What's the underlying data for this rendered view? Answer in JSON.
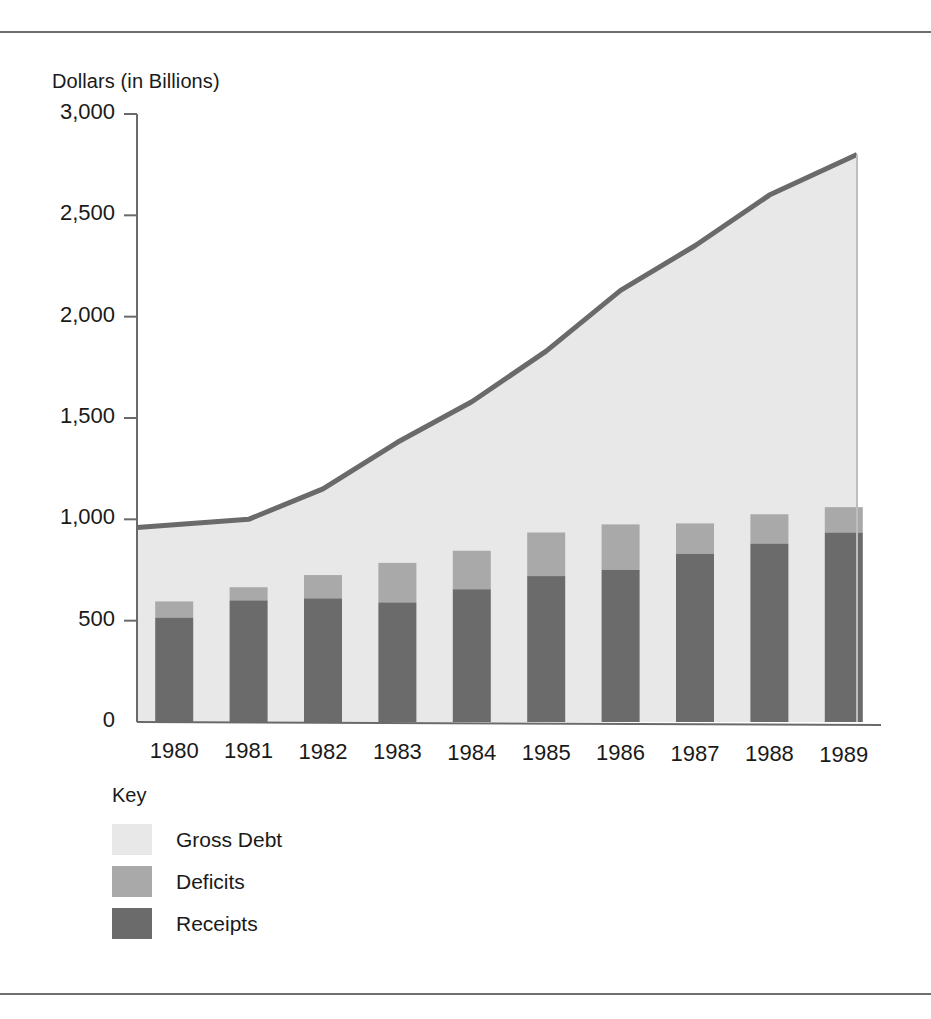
{
  "chart_data": {
    "type": "bar",
    "title": "",
    "subtitle": "",
    "ylabel": "Dollars (in Billions)",
    "xlabel": "",
    "categories": [
      "1980",
      "1981",
      "1982",
      "1983",
      "1984",
      "1985",
      "1986",
      "1987",
      "1988",
      "1989"
    ],
    "yticks": [
      "0",
      "500",
      "1,000",
      "1,500",
      "2,000",
      "2,500",
      "3,000"
    ],
    "ytick_values": [
      0,
      500,
      1000,
      1500,
      2000,
      2500,
      3000
    ],
    "ylim": [
      0,
      3000
    ],
    "grid": false,
    "legend_position": "below-left",
    "legend_title": "Key",
    "series": [
      {
        "name": "Gross Debt",
        "render": "area-line",
        "color": "#e8e8e8",
        "line_color": "#6a6a6a",
        "values": [
          960,
          1000,
          1150,
          1380,
          1580,
          1830,
          2130,
          2350,
          2600,
          2800
        ]
      },
      {
        "name": "Deficits",
        "render": "stacked-bar-top",
        "color": "#a9a9a9",
        "values": [
          80,
          65,
          115,
          195,
          190,
          215,
          225,
          150,
          145,
          125
        ]
      },
      {
        "name": "Receipts",
        "render": "stacked-bar-bottom",
        "color": "#6b6b6b",
        "values": [
          515,
          600,
          610,
          590,
          655,
          720,
          750,
          830,
          880,
          935
        ]
      }
    ],
    "bar_totals": [
      595,
      665,
      725,
      785,
      845,
      935,
      975,
      980,
      1025,
      1060
    ],
    "axis_color": "#6a6a6a",
    "background": "#ffffff"
  },
  "legend": {
    "title": "Key",
    "items": [
      {
        "label": "Gross Debt",
        "color": "#e8e8e8"
      },
      {
        "label": "Deficits",
        "color": "#a9a9a9"
      },
      {
        "label": "Receipts",
        "color": "#6b6b6b"
      }
    ]
  },
  "axis": {
    "y_title": "Dollars (in Billions)"
  },
  "footer": {
    "ghost_text": ""
  }
}
